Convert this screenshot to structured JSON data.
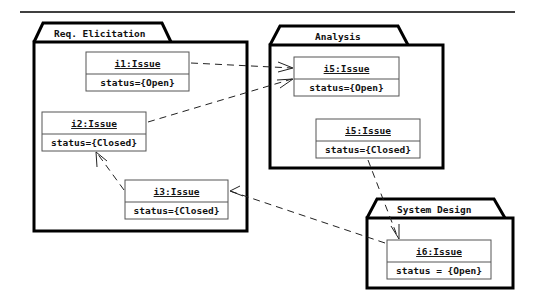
{
  "diagram": {
    "type": "UML object diagram with packages",
    "colors": {
      "line": "#000000",
      "object_border": "#555555",
      "background": "#ffffff"
    },
    "packages": [
      {
        "id": "req",
        "title": "Req. Elicitation"
      },
      {
        "id": "analysis",
        "title": "Analysis"
      },
      {
        "id": "sysdesign",
        "title": "System Design"
      }
    ],
    "objects": [
      {
        "id": "i1",
        "name": "i1:Issue",
        "attribute": "status={Open}",
        "package": "Req. Elicitation"
      },
      {
        "id": "i2",
        "name": "i2:Issue",
        "attribute": "status={Closed}",
        "package": "Req. Elicitation"
      },
      {
        "id": "i3",
        "name": "i3:Issue",
        "attribute": "status={Closed}",
        "package": "Req. Elicitation"
      },
      {
        "id": "i5a",
        "name": "i5:Issue",
        "attribute": "status={Open}",
        "package": "Analysis"
      },
      {
        "id": "i5b",
        "name": "i5:Issue",
        "attribute": "status={Closed}",
        "package": "Analysis"
      },
      {
        "id": "i6",
        "name": "i6:Issue",
        "attribute": "status = {Open}",
        "package": "System Design"
      }
    ],
    "dependencies": [
      {
        "from": "i1:Issue",
        "to": "i5:Issue (Open)",
        "style": "dashed-open-arrow"
      },
      {
        "from": "i2:Issue",
        "to": "i5:Issue (Open)",
        "style": "dashed-open-arrow"
      },
      {
        "from": "i3:Issue",
        "to": "i2:Issue",
        "style": "dashed-open-arrow"
      },
      {
        "from": "i6:Issue",
        "to": "i3:Issue",
        "style": "dashed-open-arrow"
      },
      {
        "from": "i5:Issue (Closed)",
        "to": "i6:Issue",
        "style": "dashed-open-arrow"
      }
    ]
  }
}
